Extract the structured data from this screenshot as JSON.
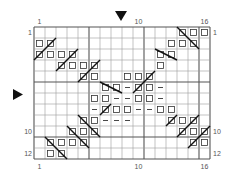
{
  "chart": {
    "cols": 16,
    "rows": 12,
    "origin_x": 34,
    "origin_y": 27,
    "cell": 11,
    "thick_every": 5,
    "col_labels_top": [
      {
        "col": 1,
        "text": "1"
      },
      {
        "col": 10,
        "text": "10"
      },
      {
        "col": 16,
        "text": "16"
      }
    ],
    "col_labels_bottom": [
      {
        "col": 1,
        "text": "1"
      },
      {
        "col": 10,
        "text": "10"
      },
      {
        "col": 16,
        "text": "16"
      }
    ],
    "row_labels_left": [
      {
        "row": 1,
        "text": "1"
      },
      {
        "row": 10,
        "text": "10"
      },
      {
        "row": 12,
        "text": "12"
      }
    ],
    "row_labels_right": [
      {
        "row": 1,
        "text": "1"
      },
      {
        "row": 10,
        "text": "10"
      },
      {
        "row": 12,
        "text": "12"
      }
    ],
    "markers": {
      "top_arrow": {
        "icon": "down-triangle-icon",
        "x": 121,
        "y": 11
      },
      "left_arrow": {
        "icon": "right-triangle-icon",
        "x": 13,
        "y": 94
      }
    },
    "legend_symbols": {
      "square": "open-square",
      "dash": "dash",
      "slash": "right-leaning-decrease",
      "backslash": "left-leaning-decrease"
    },
    "squares": [
      [
        1,
        14
      ],
      [
        1,
        15
      ],
      [
        1,
        16
      ],
      [
        2,
        1
      ],
      [
        2,
        2
      ],
      [
        2,
        13
      ],
      [
        2,
        14
      ],
      [
        2,
        15
      ],
      [
        3,
        1
      ],
      [
        3,
        2
      ],
      [
        3,
        3
      ],
      [
        3,
        4
      ],
      [
        3,
        12
      ],
      [
        3,
        13
      ],
      [
        4,
        3
      ],
      [
        4,
        4
      ],
      [
        4,
        5
      ],
      [
        4,
        6
      ],
      [
        4,
        12
      ],
      [
        5,
        5
      ],
      [
        5,
        6
      ],
      [
        5,
        9
      ],
      [
        5,
        10
      ],
      [
        5,
        11
      ],
      [
        6,
        7
      ],
      [
        6,
        8
      ],
      [
        6,
        10
      ],
      [
        6,
        11
      ],
      [
        7,
        6
      ],
      [
        7,
        7
      ],
      [
        7,
        10
      ],
      [
        7,
        11
      ],
      [
        8,
        7
      ],
      [
        8,
        8
      ],
      [
        8,
        9
      ],
      [
        8,
        12
      ],
      [
        8,
        13
      ],
      [
        9,
        5
      ],
      [
        9,
        6
      ],
      [
        9,
        13
      ],
      [
        9,
        14
      ],
      [
        9,
        15
      ],
      [
        10,
        4
      ],
      [
        10,
        5
      ],
      [
        10,
        6
      ],
      [
        10,
        14
      ],
      [
        10,
        15
      ],
      [
        10,
        16
      ],
      [
        11,
        2
      ],
      [
        11,
        3
      ],
      [
        11,
        4
      ],
      [
        11,
        5
      ],
      [
        11,
        15
      ],
      [
        11,
        16
      ],
      [
        12,
        2
      ],
      [
        12,
        3
      ]
    ],
    "dashes": [
      [
        6,
        9
      ],
      [
        6,
        12
      ],
      [
        7,
        8
      ],
      [
        7,
        9
      ],
      [
        7,
        12
      ],
      [
        8,
        6
      ],
      [
        8,
        10
      ],
      [
        8,
        11
      ],
      [
        9,
        7
      ],
      [
        9,
        8
      ],
      [
        9,
        9
      ]
    ],
    "lines": [
      {
        "type": "slash",
        "from": [
          3,
          1
        ],
        "to": [
          2,
          2
        ]
      },
      {
        "type": "slash",
        "from": [
          4,
          3
        ],
        "to": [
          3,
          4
        ]
      },
      {
        "type": "slash",
        "from": [
          5,
          5
        ],
        "to": [
          4,
          6
        ]
      },
      {
        "type": "backslash",
        "from": [
          1,
          14
        ],
        "to": [
          2,
          15
        ]
      },
      {
        "type": "backslash",
        "from": [
          3,
          12
        ],
        "to": [
          3,
          13
        ]
      },
      {
        "type": "slash",
        "from": [
          6,
          10
        ],
        "to": [
          5,
          11
        ]
      },
      {
        "type": "backslash",
        "from": [
          6,
          7
        ],
        "to": [
          6,
          8
        ]
      },
      {
        "type": "slash",
        "from": [
          8,
          7
        ],
        "to": [
          8,
          7
        ]
      },
      {
        "type": "backslash",
        "from": [
          9,
          5
        ],
        "to": [
          10,
          6
        ]
      },
      {
        "type": "backslash",
        "from": [
          10,
          4
        ],
        "to": [
          11,
          5
        ]
      },
      {
        "type": "backslash",
        "from": [
          11,
          2
        ],
        "to": [
          12,
          3
        ]
      },
      {
        "type": "slash",
        "from": [
          9,
          13
        ],
        "to": [
          9,
          13
        ]
      },
      {
        "type": "slash",
        "from": [
          10,
          14
        ],
        "to": [
          9,
          15
        ]
      },
      {
        "type": "slash",
        "from": [
          11,
          15
        ],
        "to": [
          10,
          16
        ]
      }
    ],
    "colors": {
      "grid": "#9a9a9a",
      "thick": "#555555",
      "symbol": "#333333",
      "line": "#111111",
      "arrow": "#111111"
    }
  }
}
